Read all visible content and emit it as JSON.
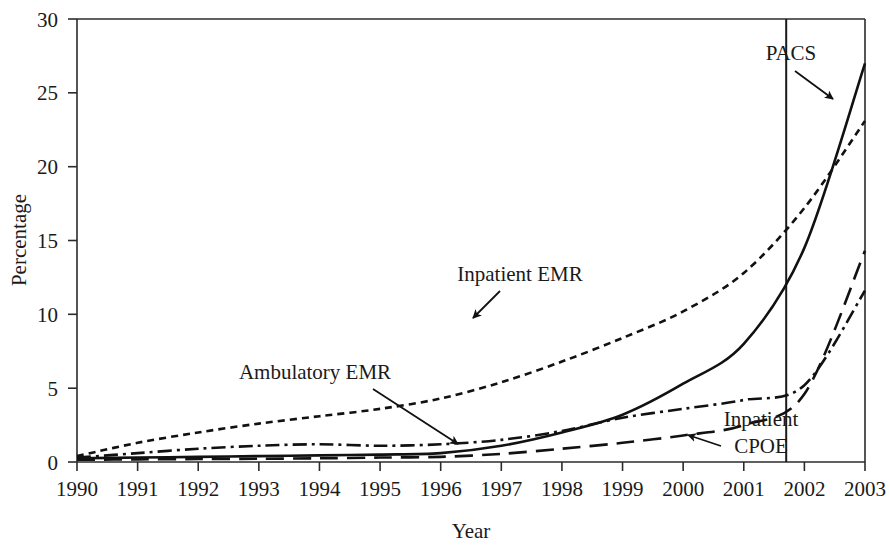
{
  "chart_data": {
    "type": "line",
    "title": "",
    "xlabel": "Year",
    "ylabel": "Percentage",
    "xlim": [
      1990,
      2003
    ],
    "ylim": [
      0,
      30
    ],
    "ytick_values": [
      0,
      5,
      10,
      15,
      20,
      25,
      30
    ],
    "ytick_labels": [
      "0",
      "5",
      "10",
      "15",
      "20",
      "25",
      "30"
    ],
    "xtick_values": [
      1990,
      1991,
      1992,
      1993,
      1994,
      1995,
      1996,
      1997,
      1998,
      1999,
      2000,
      2001,
      2002,
      2003
    ],
    "xtick_labels": [
      "1990",
      "1991",
      "1992",
      "1993",
      "1994",
      "1995",
      "1996",
      "1997",
      "1998",
      "1999",
      "2000",
      "2001",
      "2002",
      "2003"
    ],
    "grid": false,
    "legend_position": "inline-annotations",
    "x": [
      1990,
      1991,
      1992,
      1993,
      1994,
      1995,
      1996,
      1997,
      1998,
      1999,
      2000,
      2001,
      2002,
      2003
    ],
    "series": [
      {
        "name": "Inpatient EMR",
        "style": "short-dashed",
        "dash_pattern": "7,5",
        "color": "#111111",
        "values": [
          0.4,
          1.3,
          2.0,
          2.6,
          3.1,
          3.6,
          4.3,
          5.4,
          6.8,
          8.4,
          10.2,
          12.8,
          17.2,
          23.1
        ]
      },
      {
        "name": "Ambulatory EMR",
        "style": "dash-dot",
        "dash_pattern": "14,5,3,5",
        "color": "#111111",
        "values": [
          0.3,
          0.6,
          0.9,
          1.1,
          1.2,
          1.1,
          1.2,
          1.5,
          2.1,
          3.0,
          3.6,
          4.2,
          5.2,
          11.6
        ]
      },
      {
        "name": "PACS",
        "style": "solid",
        "dash_pattern": "none",
        "color": "#111111",
        "values": [
          0.25,
          0.3,
          0.35,
          0.4,
          0.45,
          0.5,
          0.6,
          1.1,
          2.0,
          3.2,
          5.3,
          8.0,
          14.5,
          27.0
        ]
      },
      {
        "name": "Inpatient CPOE",
        "style": "long-dashed",
        "dash_pattern": "18,9",
        "color": "#111111",
        "values": [
          0.15,
          0.18,
          0.2,
          0.22,
          0.25,
          0.3,
          0.35,
          0.55,
          0.9,
          1.3,
          1.8,
          2.5,
          4.6,
          14.3
        ]
      }
    ],
    "annotations": [
      {
        "label": "Inpatient EMR",
        "target_series": "Inpatient EMR",
        "text_x": 520,
        "text_y": 281,
        "tip_x": 473,
        "tip_y": 318
      },
      {
        "label": "Ambulatory EMR",
        "target_series": "Ambulatory EMR",
        "text_x": 315,
        "text_y": 379,
        "tip_x": 458,
        "tip_y": 444
      },
      {
        "label": "PACS",
        "target_series": "PACS",
        "text_x": 791,
        "text_y": 60,
        "tip_x": 833,
        "tip_y": 99
      },
      {
        "label": "Inpatient CPOE",
        "target_series": "Inpatient CPOE",
        "text_x": 761,
        "text_y": 426,
        "tip_x": 688,
        "tip_y": 435
      }
    ],
    "reference_line": {
      "orientation": "vertical",
      "x_value": 2001.7,
      "label": "",
      "color": "#1a1a1a"
    }
  }
}
